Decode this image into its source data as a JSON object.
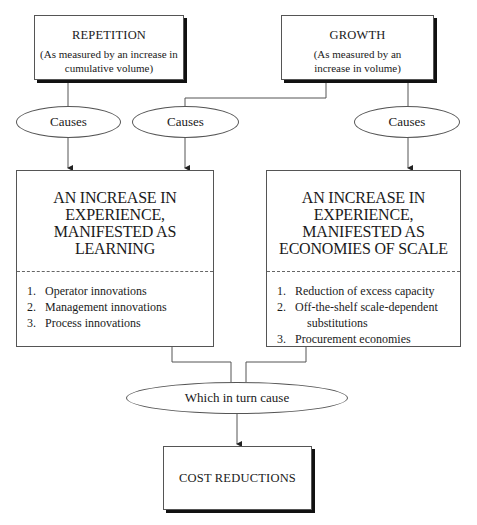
{
  "repetition": {
    "title": "REPETITION",
    "subtitle_line1": "(As measured by an increase in",
    "subtitle_line2": "cumulative volume)"
  },
  "growth": {
    "title": "GROWTH",
    "subtitle_line1": "(As measured by an",
    "subtitle_line2": "increase in  volume)"
  },
  "causes": {
    "left": "Causes",
    "middle": "Causes",
    "right": "Causes"
  },
  "learning": {
    "heading_lines": [
      "AN INCREASE IN",
      "EXPERIENCE,",
      "MANIFESTED AS",
      "LEARNING"
    ],
    "items": [
      {
        "num": "1.",
        "text": "Operator innovations"
      },
      {
        "num": "2.",
        "text": "Management innovations"
      },
      {
        "num": "3.",
        "text": "Process innovations"
      }
    ]
  },
  "scale": {
    "heading_lines": [
      "AN INCREASE IN",
      "EXPERIENCE,",
      "MANIFESTED AS",
      "ECONOMIES OF SCALE"
    ],
    "items": [
      {
        "num": "1.",
        "text": "Reduction of excess capacity"
      },
      {
        "num": "2.",
        "text": "Off-the-shelf scale-dependent",
        "cont": "substitutions"
      },
      {
        "num": "3.",
        "text": "Procurement economies"
      }
    ]
  },
  "which_in_turn": "Which in turn cause",
  "cost_reductions": "COST REDUCTIONS"
}
